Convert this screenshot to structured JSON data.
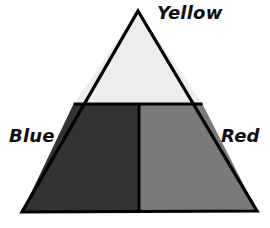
{
  "diagram": {
    "type": "subdivided-triangle",
    "background_color": "#FFFFFF",
    "outline_color": "#000000",
    "outline_width_px": 3,
    "apex": {
      "x": 138,
      "y": 11
    },
    "base_left": {
      "x": 22,
      "y": 212
    },
    "base_right": {
      "x": 257,
      "y": 211
    },
    "horizontal_divider_y": 104,
    "vertical_divider_x": 139,
    "regions": [
      {
        "key": "yellow",
        "label": "Yellow",
        "position": "top",
        "fill": "#EDEDED",
        "label_x": 157,
        "label_y": 4
      },
      {
        "key": "blue",
        "label": "Blue",
        "position": "bottom-left",
        "fill": "#333333",
        "label_x": 9,
        "label_y": 127
      },
      {
        "key": "red",
        "label": "Red",
        "position": "bottom-right",
        "fill": "#7A7A7A",
        "label_x": 221,
        "label_y": 127
      }
    ]
  }
}
